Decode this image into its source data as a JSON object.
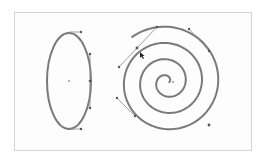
{
  "canvas": {
    "frame": {
      "x": 14,
      "y": 12,
      "width": 238,
      "height": 139,
      "border_color": "#d4d4d4"
    },
    "stroke_color": "#7a7a7a",
    "handle_color": "#8c8c8c"
  },
  "shapes": {
    "ellipse": {
      "cx": 69,
      "cy": 81,
      "rx": 22,
      "ry": 48,
      "handles": [
        {
          "anchor": [
            69,
            32
          ],
          "control": [
            81,
            32
          ]
        },
        {
          "anchor": [
            90,
            81
          ],
          "control_a": [
            90,
            54
          ],
          "control_b": [
            90,
            108
          ]
        },
        {
          "anchor": [
            69,
            129
          ],
          "control": [
            81,
            129
          ]
        }
      ]
    },
    "spiral": {
      "cx": 167,
      "cy": 82,
      "turns": 3.5,
      "outer_radius": 57,
      "end_point": [
        209,
        125
      ],
      "handles": [
        {
          "anchor": [
            137,
            48
          ],
          "control_a": [
            157,
            27
          ],
          "control_b": [
            119,
            67
          ]
        },
        {
          "anchor": [
            209,
            51
          ],
          "control": [
            189,
            29
          ]
        },
        {
          "anchor": [
            135,
            116
          ],
          "control": [
            117,
            98
          ]
        }
      ]
    }
  },
  "cursor": {
    "type": "direct-selection-arrow",
    "x": 140,
    "y": 52
  }
}
